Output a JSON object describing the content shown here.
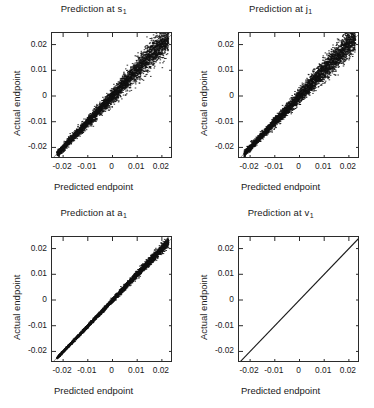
{
  "figure": {
    "background_color": "#ffffff",
    "point_color": "#111111",
    "identity_line_color": "#8a8a8a",
    "axis_color": "#2b2b2b",
    "layout": "2x2 grid of scatter panels"
  },
  "axes": {
    "xlabel": "Predicted endpoint",
    "ylabel": "Actual endpoint",
    "xticks": [
      "-0.02",
      "-0.01",
      "0",
      "0.01",
      "0.02"
    ],
    "yticks": [
      "0.02",
      "0.01",
      "0",
      "-0.01",
      "-0.02"
    ],
    "xtick_values": [
      -0.02,
      -0.01,
      0,
      0.01,
      0.02
    ],
    "ytick_values": [
      0.02,
      0.01,
      0,
      -0.01,
      -0.02
    ],
    "xlim": [
      -0.0245,
      0.0245
    ],
    "ylim": [
      -0.0245,
      0.0245
    ],
    "grid": false,
    "tick_direction": "in"
  },
  "chart_data": [
    {
      "type": "scatter",
      "title": "Prediction at s",
      "title_subscript": "1",
      "xlabel": "Predicted endpoint",
      "ylabel": "Actual endpoint",
      "xlim": [
        -0.0245,
        0.0245
      ],
      "ylim": [
        -0.0245,
        0.0245
      ],
      "xticks": [
        -0.02,
        -0.01,
        0,
        0.01,
        0.02
      ],
      "yticks": [
        -0.02,
        -0.01,
        0,
        0.01,
        0.02
      ],
      "grid": false,
      "legend": null,
      "identity_line": true,
      "n_points": 4200,
      "spread": 0.00175,
      "spread_slope": 0.055,
      "seed": 11,
      "description": "Dense diagonal band along y=x, scatter widens toward upper right"
    },
    {
      "type": "scatter",
      "title": "Prediction at j",
      "title_subscript": "1",
      "xlabel": "Predicted endpoint",
      "ylabel": "Actual endpoint",
      "xlim": [
        -0.0245,
        0.0245
      ],
      "ylim": [
        -0.0245,
        0.0245
      ],
      "xticks": [
        -0.02,
        -0.01,
        0,
        0.01,
        0.02
      ],
      "yticks": [
        -0.02,
        -0.01,
        0,
        0.01,
        0.02
      ],
      "grid": false,
      "legend": null,
      "identity_line": true,
      "n_points": 4200,
      "spread": 0.00165,
      "spread_slope": 0.052,
      "seed": 29,
      "description": "Dense diagonal band along y=x, scatter widens toward upper right"
    },
    {
      "type": "scatter",
      "title": "Prediction at a",
      "title_subscript": "1",
      "xlabel": "Predicted endpoint",
      "ylabel": "Actual endpoint",
      "xlim": [
        -0.0245,
        0.0245
      ],
      "ylim": [
        -0.0245,
        0.0245
      ],
      "xticks": [
        -0.02,
        -0.01,
        0,
        0.01,
        0.02
      ],
      "yticks": [
        -0.02,
        -0.01,
        0,
        0.01,
        0.02
      ],
      "grid": false,
      "legend": null,
      "identity_line": true,
      "n_points": 4200,
      "spread": 0.00052,
      "spread_slope": 0.03,
      "seed": 47,
      "description": "Tight diagonal band along y=x with small upward scatter"
    },
    {
      "type": "scatter",
      "title": "Prediction at v",
      "title_subscript": "1",
      "xlabel": "Predicted endpoint",
      "ylabel": "Actual endpoint",
      "xlim": [
        -0.0245,
        0.0245
      ],
      "ylim": [
        -0.0245,
        0.0245
      ],
      "xticks": [
        -0.02,
        -0.01,
        0,
        0.01,
        0.02
      ],
      "yticks": [
        -0.02,
        -0.01,
        0,
        0.01,
        0.02
      ],
      "grid": false,
      "legend": null,
      "identity_line": true,
      "n_points": 0,
      "spread": 0.0,
      "spread_slope": 0.0,
      "seed": 3,
      "description": "Perfect identity line only; prediction matches actual exactly"
    }
  ]
}
